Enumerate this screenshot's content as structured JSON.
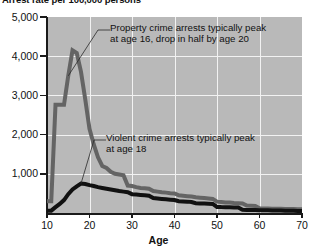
{
  "chart_data": {
    "type": "line",
    "title": "Arrest rate per 100,000 persons",
    "xlabel": "Age",
    "ylabel": "",
    "xlim": [
      10,
      70
    ],
    "ylim": [
      0,
      5000
    ],
    "grid": true,
    "legend_position": "none",
    "y_ticks": [
      "1,000",
      "2,000",
      "3,000",
      "4,000",
      "5,000"
    ],
    "y_tick_values": [
      1000,
      2000,
      3000,
      4000,
      5000
    ],
    "x_ticks": [
      "10",
      "20",
      "30",
      "40",
      "50",
      "60",
      "70"
    ],
    "x_tick_values": [
      10,
      20,
      30,
      40,
      50,
      60,
      70
    ],
    "x": [
      10,
      11,
      12,
      13,
      14,
      15,
      16,
      17,
      18,
      19,
      20,
      21,
      22,
      23,
      24,
      25,
      26,
      27,
      28,
      29,
      30,
      31,
      32,
      33,
      34,
      35,
      36,
      37,
      38,
      39,
      40,
      41,
      42,
      43,
      44,
      45,
      46,
      47,
      48,
      49,
      50,
      51,
      52,
      53,
      54,
      55,
      56,
      57,
      58,
      59,
      60,
      61,
      62,
      63,
      64,
      65,
      66,
      67,
      68,
      69,
      70
    ],
    "series": [
      {
        "name": "Property crime",
        "color": "#646464",
        "values": [
          300,
          300,
          2760,
          2760,
          2760,
          3500,
          4150,
          4080,
          3600,
          2900,
          2150,
          1750,
          1420,
          1200,
          1150,
          1050,
          1000,
          980,
          960,
          700,
          690,
          660,
          640,
          630,
          620,
          560,
          545,
          530,
          520,
          505,
          500,
          450,
          440,
          430,
          420,
          400,
          390,
          380,
          370,
          360,
          290,
          280,
          270,
          265,
          255,
          250,
          245,
          190,
          185,
          180,
          120,
          115,
          112,
          110,
          108,
          106,
          104,
          102,
          100,
          98,
          95
        ]
      },
      {
        "name": "Violent crime",
        "color": "#111111",
        "values": [
          60,
          60,
          150,
          230,
          330,
          480,
          600,
          680,
          750,
          740,
          710,
          690,
          660,
          640,
          620,
          600,
          580,
          560,
          545,
          530,
          480,
          470,
          460,
          450,
          440,
          380,
          370,
          360,
          350,
          340,
          330,
          300,
          295,
          290,
          280,
          250,
          245,
          240,
          235,
          230,
          155,
          150,
          148,
          145,
          142,
          140,
          80,
          78,
          76,
          74,
          72,
          70,
          68,
          66,
          64,
          62,
          60,
          58,
          56,
          54,
          52
        ]
      }
    ],
    "annotations": [
      {
        "id": "property",
        "lines": [
          "Property crime arrests typically peak",
          "at age 16, drop in half by age 20"
        ],
        "target_age": 15,
        "target_value": 3500
      },
      {
        "id": "violent",
        "lines": [
          "Violent crime arrests typically peak",
          "at age 18"
        ],
        "target_age": 18,
        "target_value": 750
      }
    ]
  }
}
